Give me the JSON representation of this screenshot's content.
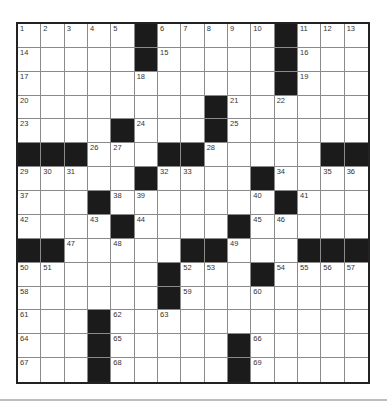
{
  "puzzle": {
    "size": {
      "rows": 15,
      "cols": 15
    },
    "colors": {
      "block": "#1b1b1b",
      "cell": "#ffffff",
      "border": "#222222",
      "gridline": "#8a8a8a"
    },
    "layout": [
      "....#.....#...",
      "..."
    ],
    "rows": [
      [
        "1",
        "2",
        "3",
        "4",
        "5",
        "#",
        "6",
        "7",
        "8",
        "9",
        "10",
        "#",
        "11",
        "12",
        "13"
      ],
      [
        "14",
        "",
        "",
        "",
        "",
        "#",
        "15",
        "",
        "",
        "",
        "",
        "#",
        "16",
        "",
        ""
      ],
      [
        "17",
        "",
        "",
        "",
        "",
        "18",
        "",
        "",
        "",
        "",
        "",
        "#",
        "19",
        "",
        ""
      ],
      [
        "20",
        "",
        "",
        "",
        "",
        "",
        "",
        "",
        "#",
        "21",
        "",
        "22",
        "",
        "",
        ""
      ],
      [
        "23",
        "",
        "",
        "",
        "#",
        "24",
        "",
        "",
        "#",
        "25",
        "",
        "",
        "",
        "",
        ""
      ],
      [
        "#",
        "#",
        "#",
        "26",
        "27",
        "",
        "#",
        "#",
        "28",
        "",
        "",
        "",
        "",
        "#",
        "#"
      ],
      [
        "29",
        "30",
        "31",
        "",
        "",
        "#",
        "32",
        "33",
        "",
        "",
        "#",
        "34",
        "",
        "35",
        "36"
      ],
      [
        "37",
        "",
        "",
        "#",
        "38",
        "39",
        "",
        "",
        "",
        "",
        "40",
        "#",
        "41",
        "",
        ""
      ],
      [
        "42",
        "",
        "",
        "43",
        "#",
        "44",
        "",
        "",
        "",
        "#",
        "45",
        "46",
        "",
        "",
        ""
      ],
      [
        "#",
        "#",
        "47",
        "",
        "48",
        "",
        "",
        "#",
        "#",
        "49",
        "",
        "",
        "#",
        "#",
        "#"
      ],
      [
        "50",
        "51",
        "",
        "",
        "",
        "",
        "#",
        "52",
        "53",
        "",
        "#",
        "54",
        "55",
        "56",
        "57"
      ],
      [
        "58",
        "",
        "",
        "",
        "",
        "",
        "#",
        "59",
        "",
        "",
        "60",
        "",
        "",
        "",
        ""
      ],
      [
        "61",
        "",
        "",
        "#",
        "62",
        "",
        "63",
        "",
        "",
        "",
        "",
        "",
        "",
        "",
        ""
      ],
      [
        "64",
        "",
        "",
        "#",
        "65",
        "",
        "",
        "",
        "",
        "#",
        "66",
        "",
        "",
        "",
        ""
      ],
      [
        "67",
        "",
        "",
        "#",
        "68",
        "",
        "",
        "",
        "",
        "#",
        "69",
        "",
        "",
        "",
        ""
      ]
    ]
  }
}
